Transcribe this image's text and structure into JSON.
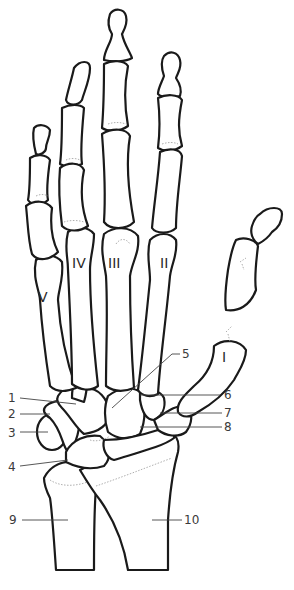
{
  "diagram": {
    "metacarpal_labels": [
      {
        "id": "I",
        "text": "I"
      },
      {
        "id": "II",
        "text": "II"
      },
      {
        "id": "III",
        "text": "III"
      },
      {
        "id": "IV",
        "text": "IV"
      },
      {
        "id": "V",
        "text": "V"
      }
    ],
    "callouts": [
      {
        "number": "1",
        "side": "left"
      },
      {
        "number": "2",
        "side": "left"
      },
      {
        "number": "3",
        "side": "left"
      },
      {
        "number": "4",
        "side": "left"
      },
      {
        "number": "5",
        "side": "right"
      },
      {
        "number": "6",
        "side": "right"
      },
      {
        "number": "7",
        "side": "right"
      },
      {
        "number": "8",
        "side": "right"
      },
      {
        "number": "9",
        "side": "left"
      },
      {
        "number": "10",
        "side": "right"
      }
    ]
  }
}
